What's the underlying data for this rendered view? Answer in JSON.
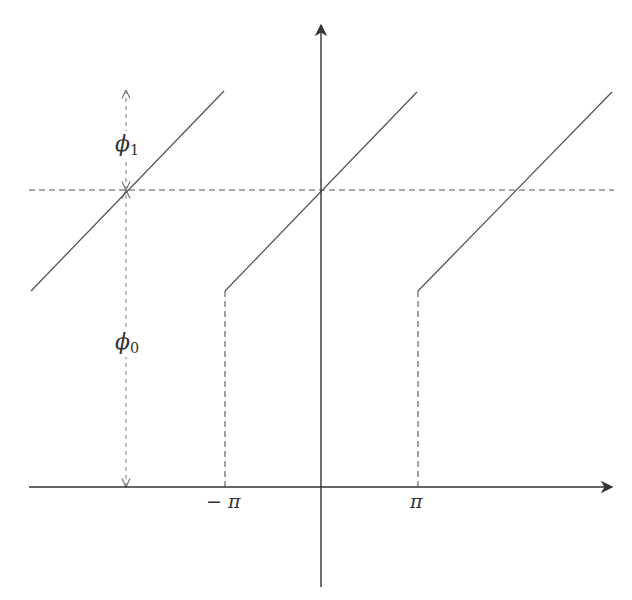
{
  "diagram": {
    "type": "sawtooth-phase-plot",
    "colors": {
      "axis": "#333333",
      "line": "#555555",
      "dashed": "#555555",
      "indicator": "#777777",
      "background": "#ffffff"
    },
    "axes": {
      "origin": [
        321,
        487
      ],
      "x_axis": {
        "from": [
          29,
          487
        ],
        "to": [
          612,
          487
        ]
      },
      "y_axis": {
        "from": [
          321,
          587
        ],
        "to": [
          321,
          25
        ]
      }
    },
    "tick_labels": {
      "neg_pi": {
        "text": "− π",
        "sub": "",
        "x": 206,
        "y": 492
      },
      "pi": {
        "text": "π",
        "sub": "",
        "x": 410,
        "y": 492
      }
    },
    "phi_labels": {
      "phi1": {
        "text": "ϕ",
        "sub": "1",
        "x": 114,
        "y": 131
      },
      "phi0": {
        "text": "ϕ",
        "sub": "0",
        "x": 114,
        "y": 329
      }
    },
    "reference_level_y": 190,
    "segments": [
      {
        "name": "left-branch",
        "from": [
          31,
          291
        ],
        "to": [
          224,
          91
        ]
      },
      {
        "name": "center-branch",
        "from": [
          225,
          291
        ],
        "to": [
          417,
          92
        ]
      },
      {
        "name": "right-branch",
        "from": [
          418,
          291
        ],
        "to": [
          612,
          92
        ]
      }
    ],
    "dashed_lines": [
      {
        "name": "reference-horizontal",
        "from": [
          29,
          190
        ],
        "to": [
          614,
          190
        ]
      },
      {
        "name": "drop-neg-pi",
        "from": [
          225,
          291
        ],
        "to": [
          225,
          487
        ]
      },
      {
        "name": "drop-pi",
        "from": [
          418,
          291
        ],
        "to": [
          418,
          487
        ]
      }
    ],
    "indicators": [
      {
        "name": "phi1-span",
        "x": 126,
        "y_top": 90,
        "y_bottom": 190
      },
      {
        "name": "phi0-span",
        "x": 126,
        "y_top": 190,
        "y_bottom": 487
      }
    ]
  }
}
